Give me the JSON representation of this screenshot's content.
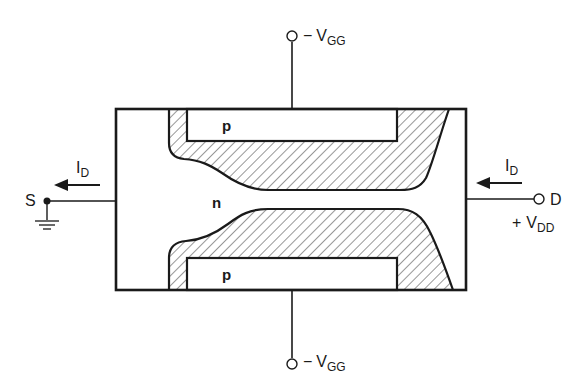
{
  "diagram": {
    "colors": {
      "stroke": "#1a1a1a",
      "background": "#ffffff"
    },
    "regions": {
      "channel": "n",
      "gate_top": "p",
      "gate_bottom": "p"
    },
    "terminals": {
      "source": {
        "label": "S",
        "ground": true
      },
      "drain": {
        "label": "D",
        "supply_sign": "+",
        "supply_main": "V",
        "supply_sub": "DD"
      },
      "gate_top": {
        "sign": "−",
        "main": "V",
        "sub": "GG"
      },
      "gate_bottom": {
        "sign": "−",
        "main": "V",
        "sub": "GG"
      }
    },
    "currents": {
      "source_current": {
        "main": "I",
        "sub": "D",
        "direction": "left"
      },
      "drain_current": {
        "main": "I",
        "sub": "D",
        "direction": "left"
      }
    }
  }
}
